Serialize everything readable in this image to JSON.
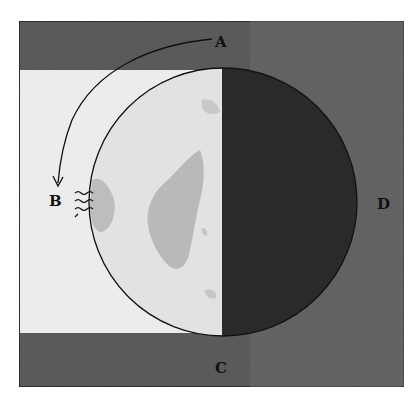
{
  "figure": {
    "labels": {
      "A": "A",
      "B": "B",
      "C": "C",
      "D": "D"
    },
    "colors": {
      "background_dark": "#5e5e5e",
      "light_band": "#ececec",
      "lit_moon": "#e4e4e4",
      "maria": "#b8b8b8",
      "dark_moon": "#2a2a2a",
      "outline": "#111111"
    },
    "arrow": {
      "from": "A",
      "to": "B",
      "shape": "curved-arc"
    }
  }
}
